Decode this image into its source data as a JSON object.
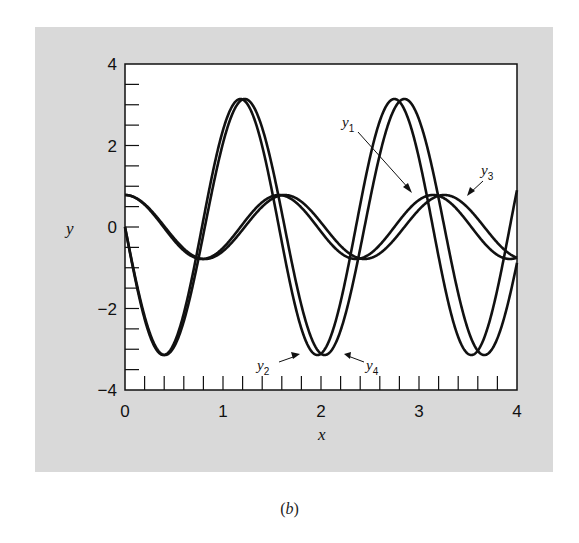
{
  "figure": {
    "caption_open": "(",
    "caption_letter": "b",
    "caption_close": ")",
    "background_color": "#d9d9d9",
    "plot_background": "#ffffff",
    "line_color": "#111111"
  },
  "axes": {
    "xlabel": "x",
    "ylabel": "y",
    "xlim": [
      0,
      4
    ],
    "ylim": [
      -4,
      4
    ],
    "x_major_ticks": [
      "0",
      "1",
      "2",
      "3",
      "4"
    ],
    "y_major_ticks": [
      "4",
      "2",
      "0",
      "−2",
      "−4"
    ],
    "x_minor_step": 0.2,
    "y_minor_step": 0.5
  },
  "labels": {
    "y1": {
      "base": "y",
      "sub": "1"
    },
    "y2": {
      "base": "y",
      "sub": "2"
    },
    "y3": {
      "base": "y",
      "sub": "3"
    },
    "y4": {
      "base": "y",
      "sub": "4"
    }
  },
  "chart_data": {
    "type": "line",
    "title": "",
    "xlabel": "x",
    "ylabel": "y",
    "xlim": [
      0,
      4
    ],
    "ylim": [
      -4,
      4
    ],
    "grid": false,
    "legend": "inline arrow annotations (y1, y2, y3, y4)",
    "x": [
      0.0,
      0.1,
      0.2,
      0.3,
      0.4,
      0.5,
      0.6,
      0.7,
      0.8,
      0.9,
      1.0,
      1.1,
      1.2,
      1.3,
      1.4,
      1.5,
      1.6,
      1.7,
      1.8,
      1.9,
      2.0,
      2.1,
      2.2,
      2.3,
      2.4,
      2.5,
      2.6,
      2.7,
      2.8,
      2.9,
      3.0,
      3.1,
      3.2,
      3.3,
      3.4,
      3.5,
      3.6,
      3.7,
      3.8,
      3.9,
      4.0
    ],
    "series": [
      {
        "name": "y1",
        "model": {
          "amp": 0.785,
          "omega": 4.0,
          "fn": "cos"
        },
        "values": [
          0.79,
          0.72,
          0.55,
          0.28,
          -0.02,
          -0.33,
          -0.58,
          -0.74,
          -0.78,
          -0.7,
          -0.51,
          -0.24,
          0.07,
          0.37,
          0.61,
          0.75,
          0.78,
          0.68,
          0.48,
          0.19,
          -0.11,
          -0.41,
          -0.64,
          -0.77,
          -0.77,
          -0.66,
          -0.44,
          -0.15,
          0.16,
          0.45,
          0.66,
          0.78,
          0.76,
          0.63,
          0.4,
          0.11,
          -0.2,
          -0.48,
          -0.68,
          -0.78,
          -0.75
        ]
      },
      {
        "name": "y2",
        "model": {
          "amp": -3.1416,
          "omega": 4.0,
          "fn": "sin"
        },
        "values": [
          0.0,
          -1.22,
          -2.25,
          -2.93,
          -3.14,
          -2.86,
          -2.12,
          -1.05,
          0.18,
          1.39,
          2.38,
          2.99,
          3.13,
          2.77,
          1.98,
          0.88,
          -0.37,
          -1.55,
          -2.49,
          -3.04,
          -3.11,
          -2.69,
          -1.84,
          -0.7,
          0.55,
          1.71,
          2.6,
          3.09,
          3.07,
          2.59,
          1.69,
          0.52,
          -0.73,
          -1.87,
          -2.71,
          -3.11,
          -3.04,
          -2.5,
          -1.56,
          -0.37,
          0.9
        ]
      },
      {
        "name": "y3",
        "model": {
          "amp": 0.785,
          "omega": 3.856,
          "fn": "cos"
        },
        "values": [
          0.79,
          0.73,
          0.56,
          0.31,
          0.02,
          -0.27,
          -0.53,
          -0.71,
          -0.78,
          -0.74,
          -0.59,
          -0.36,
          -0.07,
          0.23,
          0.5,
          0.69,
          0.78,
          0.76,
          0.62,
          0.39,
          0.12,
          -0.19,
          -0.46,
          -0.67,
          -0.77,
          -0.76,
          -0.65,
          -0.44,
          -0.15,
          0.15,
          0.42,
          0.64,
          0.76,
          0.78,
          0.67,
          0.47,
          0.19,
          -0.11,
          -0.38,
          -0.61,
          -0.75
        ]
      },
      {
        "name": "y4",
        "model": {
          "amp": -3.1416,
          "omega": 3.856,
          "fn": "sin"
        },
        "values": [
          0.0,
          -1.18,
          -2.19,
          -2.88,
          -3.14,
          -2.94,
          -2.32,
          -1.34,
          -0.18,
          1.02,
          2.05,
          2.79,
          3.13,
          3.0,
          2.43,
          1.5,
          0.36,
          -0.83,
          -1.94,
          -2.72,
          -3.11,
          -3.05,
          -2.54,
          -1.65,
          -0.53,
          0.71,
          1.78,
          2.61,
          3.08,
          3.08,
          2.64,
          1.8,
          0.7,
          -0.45,
          -1.62,
          -2.53,
          -3.04,
          -3.11,
          -2.74,
          -1.98,
          -0.91
        ]
      }
    ]
  }
}
